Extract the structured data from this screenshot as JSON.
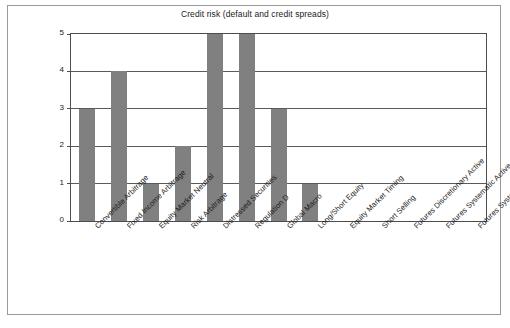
{
  "figure": {
    "title": "Credit risk (default and credit spreads)",
    "bar_color": "#808080",
    "axis_color": "#4d4d4d",
    "grid_color": "#5a5a5a",
    "background": "#ffffff",
    "frame_color": "#9a9a9a"
  },
  "chart_data": {
    "type": "bar",
    "title": "Credit risk (default and credit spreads)",
    "xlabel": "",
    "ylabel": "",
    "ylim": [
      0,
      5
    ],
    "yticks": [
      0,
      1,
      2,
      3,
      4,
      5
    ],
    "grid": true,
    "legend": null,
    "categories": [
      "Convertible Arbitrage",
      "Fixed Income Arbitrage",
      "Equity Market Neutral",
      "Risk Arbitrage",
      "Distressed Securities",
      "Regulation D",
      "Global Macro",
      "Long/Short Equity",
      "Equity Market Timing",
      "Short Selling",
      "Futures Discretionary Active",
      "Futures Systematic Active",
      "Futures Systematic Passive"
    ],
    "values": [
      3,
      4,
      1,
      2,
      5,
      5,
      3,
      1,
      0,
      0,
      0,
      0,
      0
    ]
  }
}
